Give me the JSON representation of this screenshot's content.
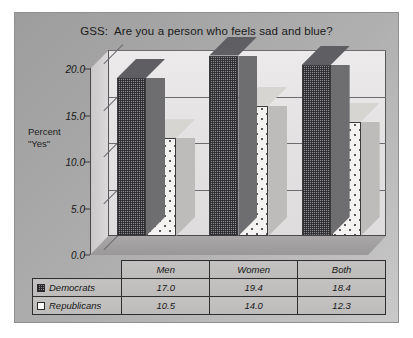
{
  "slide": {
    "title": "GSS:  Are you a person who feels sad and blue?",
    "axis_caption_line1": "Percent",
    "axis_caption_line2": "\"Yes\""
  },
  "legend": {
    "democrats_label": "Democrats",
    "republicans_label": "Republicans",
    "democrats_swatch": "dark-hatched-square-icon",
    "republicans_swatch": "white-square-icon"
  },
  "chart_data": {
    "type": "bar",
    "title": "GSS:  Are you a person who feels sad and blue?",
    "xlabel": "",
    "ylabel": "Percent \"Yes\"",
    "ylim": [
      0.0,
      20.0
    ],
    "yticks": [
      "0.0",
      "5.0",
      "10.0",
      "15.0",
      "20.0"
    ],
    "ytick_values": [
      0.0,
      5.0,
      10.0,
      15.0,
      20.0
    ],
    "grid": true,
    "legend_position": "table-below",
    "categories": [
      "Men",
      "Women",
      "Both"
    ],
    "series": [
      {
        "name": "Democrats",
        "values": [
          17.0,
          19.4,
          18.4
        ],
        "labels": [
          "17.0",
          "19.4",
          "18.4"
        ]
      },
      {
        "name": "Republicans",
        "values": [
          10.5,
          14.0,
          12.3
        ],
        "labels": [
          "10.5",
          "14.0",
          "12.3"
        ]
      }
    ]
  },
  "colors": {
    "slide_background": "#a8a8a8",
    "plot_wall": "#e6e4e4",
    "democrat_bar": "#6f6f73",
    "republican_bar": "#f4f3f1",
    "axis_line": "#3a3a3a",
    "table_background": "#c0bfbe"
  }
}
